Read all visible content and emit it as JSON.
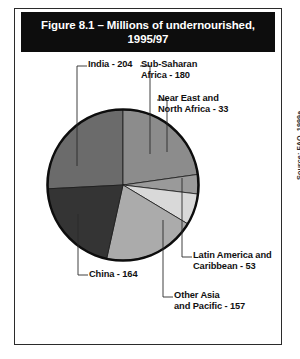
{
  "figure": {
    "title": "Figure 8.1 – Millions of undernourished,\n1995/97",
    "source": "Source: FAO, 1999a"
  },
  "chart_data": {
    "type": "pie",
    "title": "Figure 8.1 – Millions of undernourished, 1995/97",
    "unit": "millions of undernourished people",
    "period": "1995/97",
    "total": 791,
    "legend": "none",
    "labels_position": "callout",
    "categories": [
      "India",
      "Sub-Saharan Africa",
      "Near East and North Africa",
      "Latin America and Caribbean",
      "Other Asia and Pacific",
      "China"
    ],
    "values": [
      204,
      180,
      33,
      53,
      157,
      164
    ],
    "slices": [
      {
        "name": "India",
        "value": 204,
        "label": "India - 204",
        "color": "#6b6b6b",
        "start_angle": 267.1,
        "sweep": 92.9
      },
      {
        "name": "Sub-Saharan Africa",
        "value": 180,
        "label": "Sub-Saharan\nAfrica - 180",
        "color": "#8c8c8c",
        "start_angle": 0,
        "sweep": 81.9
      },
      {
        "name": "Near East and North Africa",
        "value": 33,
        "label": "Near East and\nNorth Africa - 33",
        "color": "#9a9a9a",
        "start_angle": 81.9,
        "sweep": 15.0
      },
      {
        "name": "Latin America and Caribbean",
        "value": 53,
        "label": "Latin America and\nCaribbean - 53",
        "color": "#d9d9d9",
        "start_angle": 96.9,
        "sweep": 24.1
      },
      {
        "name": "Other Asia and Pacific",
        "value": 157,
        "label": "Other Asia\nand Pacific - 157",
        "color": "#ababab",
        "start_angle": 121.0,
        "sweep": 71.5
      },
      {
        "name": "China",
        "value": 164,
        "label": "China - 164",
        "color": "#343434",
        "start_angle": 192.5,
        "sweep": 74.6
      }
    ]
  },
  "callouts": {
    "india": "India - 204",
    "sub_saharan_africa": "Sub-Saharan\nAfrica - 180",
    "near_east_north_africa": "Near East and\nNorth Africa - 33",
    "latin_america_caribbean": "Latin America and\nCaribbean - 53",
    "other_asia_pacific": "Other Asia\nand Pacific - 157",
    "china": "China - 164"
  }
}
